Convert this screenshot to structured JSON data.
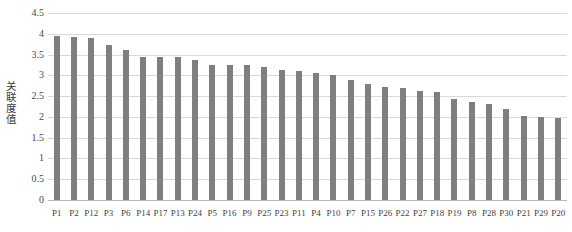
{
  "chart_data": {
    "type": "bar",
    "title": "",
    "xlabel": "",
    "ylabel": "关联度值",
    "ylim": [
      0,
      4.5
    ],
    "ytick_labels": [
      "4.5",
      "4",
      "3.5",
      "3",
      "2.5",
      "2",
      "1.5",
      "1",
      "0.5",
      "0"
    ],
    "ytick_values": [
      4.5,
      4,
      3.5,
      3,
      2.5,
      2,
      1.5,
      1,
      0.5,
      0
    ],
    "grid": "horizontal",
    "legend": "none",
    "bar_color": "#7f7f7f",
    "gridline_color": "#d9d9d9",
    "categories": [
      "P1",
      "P2",
      "P12",
      "P3",
      "P6",
      "P14",
      "P17",
      "P13",
      "P24",
      "P5",
      "P16",
      "P9",
      "P25",
      "P23",
      "P11",
      "P4",
      "P10",
      "P7",
      "P15",
      "P26",
      "P22",
      "P27",
      "P18",
      "P19",
      "P8",
      "P28",
      "P30",
      "P21",
      "P29",
      "P20"
    ],
    "values": [
      3.95,
      3.92,
      3.9,
      3.72,
      3.62,
      3.45,
      3.44,
      3.43,
      3.36,
      3.26,
      3.25,
      3.24,
      3.2,
      3.13,
      3.11,
      3.05,
      3.0,
      2.88,
      2.78,
      2.72,
      2.7,
      2.62,
      2.6,
      2.42,
      2.35,
      2.3,
      2.2,
      2.02,
      2.0,
      1.98
    ]
  }
}
